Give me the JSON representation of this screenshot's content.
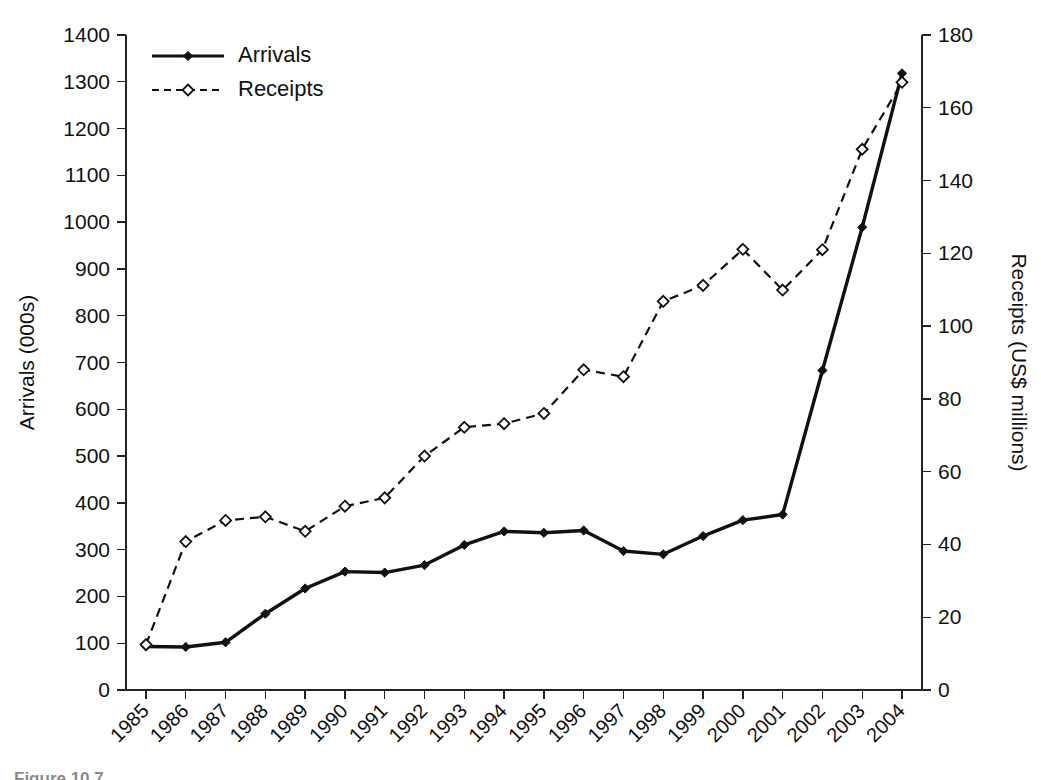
{
  "chart_data": {
    "type": "line",
    "title": "",
    "xlabel": "",
    "ylabel": "Arrivals (000s)",
    "y2label": "Receipts (US$ millions)",
    "grid": false,
    "legend_position": "top-left",
    "categories": [
      "1985",
      "1986",
      "1987",
      "1988",
      "1989",
      "1990",
      "1991",
      "1992",
      "1993",
      "1994",
      "1995",
      "1996",
      "1997",
      "1998",
      "1999",
      "2000",
      "2001",
      "2002",
      "2003",
      "2004"
    ],
    "ylim": [
      0,
      1400
    ],
    "ytick_step": 100,
    "yticks": [
      "0",
      "100",
      "200",
      "300",
      "400",
      "500",
      "600",
      "700",
      "800",
      "900",
      "1000",
      "1100",
      "1200",
      "1300",
      "1400"
    ],
    "y2lim": [
      0,
      180
    ],
    "y2tick_step": 20,
    "y2ticks": [
      "0",
      "20",
      "40",
      "60",
      "80",
      "100",
      "120",
      "140",
      "160",
      "180"
    ],
    "series": [
      {
        "name": "Arrivals",
        "axis": "left",
        "line_style": "solid",
        "marker": "filled-diamond",
        "values": [
          93,
          92,
          102,
          163,
          217,
          253,
          251,
          267,
          310,
          339,
          336,
          341,
          297,
          290,
          329,
          363,
          375,
          683,
          989,
          1318
        ]
      },
      {
        "name": "Receipts",
        "axis": "right",
        "line_style": "dashed",
        "marker": "open-diamond",
        "values": [
          12.5,
          40.8,
          46.6,
          47.6,
          43.6,
          50.5,
          52.8,
          64.3,
          72.2,
          73.2,
          76.0,
          88.0,
          86.1,
          106.8,
          111.2,
          121.1,
          109.9,
          121.0,
          148.6,
          167.0
        ]
      }
    ]
  },
  "legend": {
    "items": [
      {
        "label": "Arrivals"
      },
      {
        "label": "Receipts"
      }
    ]
  },
  "axes": {
    "left_title": "Arrivals (000s)",
    "right_title": "Receipts (US$ millions)"
  },
  "caption": {
    "text": "Figure 10.7"
  },
  "colors": {
    "ink": "#111111",
    "background": "#ffffff"
  }
}
